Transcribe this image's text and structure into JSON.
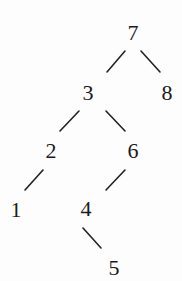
{
  "diagram": {
    "type": "binary-search-tree",
    "colors": {
      "line": "#222222",
      "text": "#1a1a1a",
      "background": "#fdfdfd"
    },
    "nodes": [
      {
        "id": "n7",
        "label": "7",
        "x": 133,
        "y": 33
      },
      {
        "id": "n3",
        "label": "3",
        "x": 88,
        "y": 93
      },
      {
        "id": "n8",
        "label": "8",
        "x": 167,
        "y": 93
      },
      {
        "id": "n2",
        "label": "2",
        "x": 51,
        "y": 151
      },
      {
        "id": "n6",
        "label": "6",
        "x": 133,
        "y": 151
      },
      {
        "id": "n1",
        "label": "1",
        "x": 16,
        "y": 210
      },
      {
        "id": "n4",
        "label": "4",
        "x": 86,
        "y": 209
      },
      {
        "id": "n5",
        "label": "5",
        "x": 114,
        "y": 268
      }
    ],
    "edges": [
      {
        "from": "7",
        "to": "3",
        "x1": 125,
        "y1": 51,
        "x2": 107,
        "y2": 72
      },
      {
        "from": "7",
        "to": "8",
        "x1": 141,
        "y1": 51,
        "x2": 160,
        "y2": 72
      },
      {
        "from": "3",
        "to": "2",
        "x1": 79,
        "y1": 111,
        "x2": 60,
        "y2": 131
      },
      {
        "from": "3",
        "to": "6",
        "x1": 106,
        "y1": 111,
        "x2": 125,
        "y2": 131
      },
      {
        "from": "2",
        "to": "1",
        "x1": 43,
        "y1": 170,
        "x2": 25,
        "y2": 190
      },
      {
        "from": "6",
        "to": "4",
        "x1": 125,
        "y1": 170,
        "x2": 106,
        "y2": 190
      },
      {
        "from": "4",
        "to": "5",
        "x1": 83,
        "y1": 228,
        "x2": 101,
        "y2": 248
      }
    ]
  }
}
